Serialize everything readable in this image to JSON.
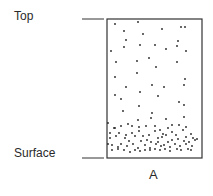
{
  "labels": {
    "top": "Top",
    "surface": "Surface",
    "column": "A"
  },
  "diagram": {
    "box": {
      "x": 107,
      "y": 19,
      "w": 95,
      "h": 139
    },
    "dots": [
      [
        115,
        24
      ],
      [
        138,
        22
      ],
      [
        162,
        29
      ],
      [
        181,
        27
      ],
      [
        185,
        27
      ],
      [
        124,
        31
      ],
      [
        143,
        34
      ],
      [
        126,
        40
      ],
      [
        178,
        41
      ],
      [
        124,
        47
      ],
      [
        140,
        45
      ],
      [
        155,
        45
      ],
      [
        166,
        49
      ],
      [
        177,
        46
      ],
      [
        111,
        51
      ],
      [
        186,
        51
      ],
      [
        116,
        62
      ],
      [
        137,
        61
      ],
      [
        149,
        58
      ],
      [
        156,
        67
      ],
      [
        177,
        62
      ],
      [
        115,
        77
      ],
      [
        137,
        73
      ],
      [
        185,
        79
      ],
      [
        184,
        85
      ],
      [
        126,
        87
      ],
      [
        152,
        85
      ],
      [
        164,
        87
      ],
      [
        140,
        92
      ],
      [
        115,
        95
      ],
      [
        158,
        96
      ],
      [
        121,
        99
      ],
      [
        179,
        102
      ],
      [
        184,
        105
      ],
      [
        139,
        106
      ],
      [
        123,
        111
      ],
      [
        152,
        113
      ],
      [
        184,
        117
      ],
      [
        151,
        118
      ],
      [
        166,
        119
      ],
      [
        138,
        120
      ],
      [
        108,
        123
      ],
      [
        115,
        128
      ],
      [
        121,
        126
      ],
      [
        128,
        124
      ],
      [
        132,
        126
      ],
      [
        139,
        127
      ],
      [
        146,
        126
      ],
      [
        155,
        126
      ],
      [
        160,
        130
      ],
      [
        168,
        128
      ],
      [
        172,
        125
      ],
      [
        179,
        125
      ],
      [
        186,
        127
      ],
      [
        191,
        134
      ],
      [
        110,
        133
      ],
      [
        114,
        128
      ],
      [
        119,
        133
      ],
      [
        126,
        135
      ],
      [
        132,
        133
      ],
      [
        139,
        131
      ],
      [
        143,
        136
      ],
      [
        149,
        135
      ],
      [
        155,
        131
      ],
      [
        158,
        138
      ],
      [
        163,
        134
      ],
      [
        166,
        135
      ],
      [
        172,
        132
      ],
      [
        176,
        135
      ],
      [
        183,
        130
      ],
      [
        186,
        137
      ],
      [
        193,
        138
      ],
      [
        197,
        139
      ],
      [
        110,
        138
      ],
      [
        116,
        136
      ],
      [
        125,
        138
      ],
      [
        129,
        141
      ],
      [
        135,
        136
      ],
      [
        141,
        141
      ],
      [
        147,
        140
      ],
      [
        151,
        142
      ],
      [
        158,
        142
      ],
      [
        162,
        137
      ],
      [
        168,
        142
      ],
      [
        172,
        140
      ],
      [
        178,
        139
      ],
      [
        184,
        141
      ],
      [
        189,
        142
      ],
      [
        195,
        140
      ],
      [
        108,
        144
      ],
      [
        112,
        145
      ],
      [
        118,
        147
      ],
      [
        121,
        144
      ],
      [
        127,
        146
      ],
      [
        133,
        144
      ],
      [
        138,
        148
      ],
      [
        145,
        145
      ],
      [
        150,
        148
      ],
      [
        156,
        144
      ],
      [
        161,
        146
      ],
      [
        164,
        145
      ],
      [
        170,
        147
      ],
      [
        175,
        144
      ],
      [
        180,
        146
      ],
      [
        186,
        144
      ],
      [
        192,
        146
      ],
      [
        112,
        150
      ],
      [
        118,
        149
      ],
      [
        124,
        150
      ],
      [
        130,
        152
      ],
      [
        135,
        150
      ],
      [
        140,
        151
      ],
      [
        145,
        150
      ],
      [
        150,
        150
      ],
      [
        155,
        149
      ],
      [
        160,
        150
      ],
      [
        165,
        149
      ],
      [
        170,
        151
      ],
      [
        177,
        149
      ],
      [
        181,
        150
      ],
      [
        188,
        149
      ],
      [
        191,
        150
      ]
    ]
  }
}
